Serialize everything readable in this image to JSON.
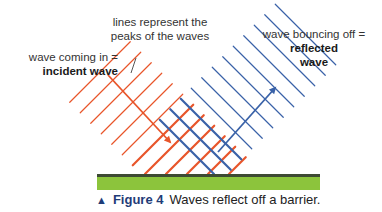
{
  "labels": {
    "incident_line1": "wave coming in =",
    "incident_line2": "incident wave",
    "peaks_line1": "lines represent the",
    "peaks_line2": "peaks of the waves",
    "reflected_line1": "wave bouncing off =",
    "reflected_line2": "reflected",
    "reflected_line3": "wave"
  },
  "caption": {
    "marker": "▲",
    "figure": "Figure 4",
    "text": "Waves reflect off a barrier."
  },
  "colors": {
    "incident": "#e8552a",
    "reflected": "#3a62a8",
    "barrier_top": "#3d4a33",
    "barrier_fill": "#8cc43c",
    "caption_accent": "#1f3c78"
  },
  "diagram": {
    "incident_wave": {
      "direction": "down-right",
      "arrow_from": [
        108,
        75
      ],
      "arrow_to": [
        170,
        142
      ]
    },
    "reflected_wave": {
      "direction": "up-right",
      "arrow_from": [
        218,
        152
      ],
      "arrow_to": [
        275,
        88
      ]
    },
    "barrier": {
      "x": 97,
      "y": 175,
      "width": 223,
      "height": 15
    }
  }
}
